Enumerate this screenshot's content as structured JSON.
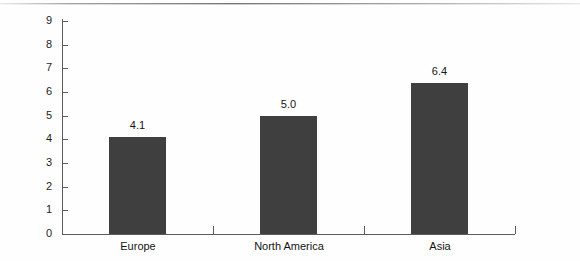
{
  "chart_data": {
    "type": "bar",
    "title": "",
    "subtitle": "",
    "xlabel": "",
    "ylabel": "",
    "categories": [
      "Europe",
      "North America",
      "Asia"
    ],
    "values": [
      4.1,
      5.0,
      6.4
    ],
    "value_labels": [
      "4.1",
      "5.0",
      "6.4"
    ],
    "ylim": [
      0,
      9
    ],
    "y_ticks": [
      "0",
      "1",
      "2",
      "3",
      "4",
      "5",
      "6",
      "7",
      "8",
      "9"
    ],
    "y_tick_step": 1,
    "grid": false,
    "legend": null,
    "series": [
      {
        "name": "",
        "values": [
          4.1,
          5.0,
          6.4
        ]
      }
    ],
    "bar_color": "#3f3f3f",
    "axis_color": "#5c5c5c",
    "background_color": "#fefefe"
  }
}
